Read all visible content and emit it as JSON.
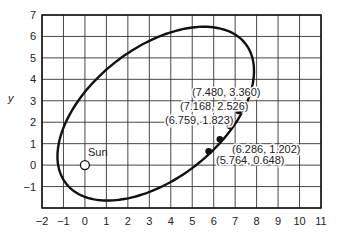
{
  "chart_data": {
    "type": "line",
    "title": "",
    "xlabel": "",
    "ylabel": "y",
    "xlim": [
      -2,
      11
    ],
    "ylim": [
      -2,
      7
    ],
    "grid": true,
    "x_ticks": [
      "-2",
      "-1",
      "0",
      "1",
      "2",
      "3",
      "4",
      "5",
      "6",
      "7",
      "8",
      "9",
      "10",
      "11"
    ],
    "y_ticks": [
      "-1",
      "0",
      "1",
      "2",
      "3",
      "4",
      "5",
      "6",
      "7"
    ],
    "series": [
      {
        "name": "orbit",
        "kind": "ellipse",
        "description": "Elliptical orbit with Sun at a focus"
      }
    ],
    "sun": {
      "label": "Sun",
      "x": 0,
      "y": 0
    },
    "points": [
      {
        "x": 7.48,
        "y": 3.36,
        "label": "(7.480,  3.360)"
      },
      {
        "x": 7.168,
        "y": 2.526,
        "label": "(7.168,  2.526)"
      },
      {
        "x": 6.759,
        "y": 1.823,
        "label": "(6.759,  1.823)"
      },
      {
        "x": 6.286,
        "y": 1.202,
        "label": "(6.286,  1.202)"
      },
      {
        "x": 5.764,
        "y": 0.648,
        "label": "(5.764,  0.648)"
      }
    ]
  }
}
